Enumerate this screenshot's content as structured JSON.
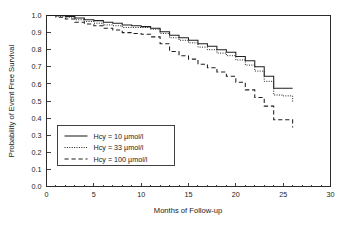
{
  "chart_data": {
    "type": "line",
    "subtype": "kaplan-meier-step",
    "title": "",
    "xlabel": "Months of Follow-up",
    "ylabel": "Probability of Event Free Survival",
    "xlim": [
      0,
      30
    ],
    "ylim": [
      0.0,
      1.0
    ],
    "xticks": [
      0,
      5,
      10,
      15,
      20,
      25,
      30
    ],
    "xtick_labels": [
      "0",
      "5",
      "10",
      "15",
      "20",
      "25",
      "30"
    ],
    "yticks": [
      0.0,
      0.1,
      0.2,
      0.3,
      0.4,
      0.5,
      0.6,
      0.7,
      0.8,
      0.9,
      1.0
    ],
    "ytick_labels": [
      "0.0",
      "0.1",
      "0.2",
      "0.3",
      "0.4",
      "0.5",
      "0.6",
      "0.7",
      "0.8",
      "0.9",
      "1.0"
    ],
    "grid": false,
    "legend_position": "lower-left",
    "series": [
      {
        "name": "Hcy = 10 µmol/l",
        "linestyle": "solid",
        "color": "#1f1f1f",
        "x": [
          0,
          1,
          2,
          3,
          4,
          5,
          6,
          7,
          8,
          9,
          10,
          11,
          12,
          13,
          14,
          15,
          16,
          17,
          18,
          19,
          20,
          21,
          22,
          23,
          24,
          25,
          26
        ],
        "y": [
          1.0,
          1.0,
          0.995,
          0.985,
          0.975,
          0.97,
          0.96,
          0.955,
          0.945,
          0.94,
          0.935,
          0.925,
          0.905,
          0.885,
          0.87,
          0.855,
          0.835,
          0.82,
          0.8,
          0.785,
          0.76,
          0.735,
          0.7,
          0.645,
          0.575,
          0.575,
          0.575
        ]
      },
      {
        "name": "Hcy = 33 µmol/l",
        "linestyle": "dotted",
        "color": "#1f1f1f",
        "x": [
          0,
          1,
          2,
          3,
          4,
          5,
          6,
          7,
          8,
          9,
          10,
          11,
          12,
          13,
          14,
          15,
          16,
          17,
          18,
          19,
          20,
          21,
          22,
          23,
          24,
          25,
          26
        ],
        "y": [
          1.0,
          0.995,
          0.99,
          0.975,
          0.965,
          0.955,
          0.945,
          0.94,
          0.93,
          0.93,
          0.93,
          0.92,
          0.895,
          0.87,
          0.855,
          0.84,
          0.815,
          0.8,
          0.78,
          0.765,
          0.74,
          0.71,
          0.675,
          0.615,
          0.535,
          0.53,
          0.495
        ]
      },
      {
        "name": "Hcy = 100 µmol/l",
        "linestyle": "dashed",
        "color": "#1f1f1f",
        "x": [
          0,
          1,
          2,
          3,
          4,
          5,
          6,
          7,
          8,
          9,
          10,
          11,
          12,
          13,
          14,
          15,
          16,
          17,
          18,
          19,
          20,
          21,
          22,
          23,
          24,
          25,
          26
        ],
        "y": [
          1.0,
          0.99,
          0.98,
          0.96,
          0.95,
          0.94,
          0.925,
          0.915,
          0.9,
          0.895,
          0.89,
          0.875,
          0.835,
          0.79,
          0.765,
          0.745,
          0.715,
          0.695,
          0.67,
          0.645,
          0.61,
          0.565,
          0.52,
          0.47,
          0.39,
          0.39,
          0.345
        ]
      }
    ]
  },
  "legend": {
    "entries": [
      {
        "label": "Hcy = 10 µmol/l",
        "style": "solid"
      },
      {
        "label": "Hcy = 33 µmol/l",
        "style": "dotted"
      },
      {
        "label": "Hcy = 100 µmol/l",
        "style": "dashed"
      }
    ]
  },
  "axes": {
    "x_title": "Months of Follow-up",
    "y_title": "Probability of Event Free Survival"
  }
}
